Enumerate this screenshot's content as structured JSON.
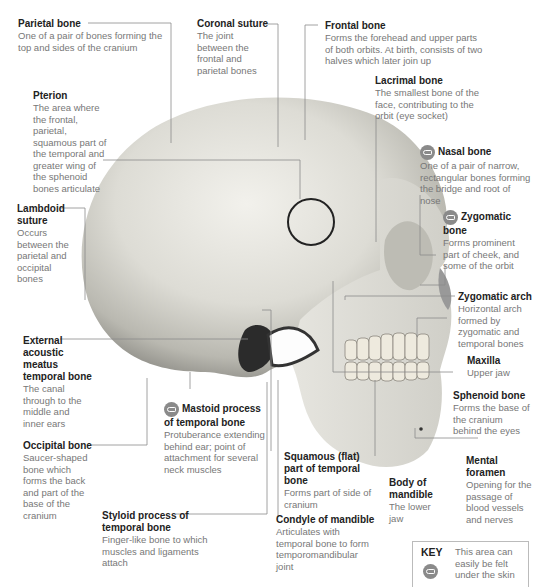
{
  "diagram": {
    "labels": [
      {
        "id": "parietal",
        "title": "Parietal bone",
        "desc": "One of a pair of bones forming the top and sides of the cranium",
        "palpable": false
      },
      {
        "id": "coronal",
        "title": "Coronal suture",
        "desc": "The joint between the frontal and parietal bones",
        "palpable": false
      },
      {
        "id": "frontal",
        "title": "Frontal bone",
        "desc": "Forms the forehead and upper parts of both orbits. At birth, consists of two halves which later join up",
        "palpable": false
      },
      {
        "id": "lacrimal",
        "title": "Lacrimal bone",
        "desc": "The smallest bone of the face, contributing to the orbit (eye socket)",
        "palpable": false
      },
      {
        "id": "pterion",
        "title": "Pterion",
        "desc": "The area where the frontal, parietal, squamous part of the temporal and greater wing of the sphenoid bones articulate",
        "palpable": false
      },
      {
        "id": "nasal",
        "title": "Nasal bone",
        "desc": "One of a pair of narrow, rectangular bones forming the bridge and root of nose",
        "palpable": true
      },
      {
        "id": "zygomatic",
        "title": "Zygomatic bone",
        "desc": "Forms prominent part of cheek, and some of the orbit",
        "palpable": true
      },
      {
        "id": "lambdoid",
        "title": "Lambdoid suture",
        "desc": "Occurs between the parietal and occipital bones",
        "palpable": false
      },
      {
        "id": "zygarch",
        "title": "Zygomatic arch",
        "desc": "Horizontal arch formed by zygomatic and temporal bones",
        "palpable": false
      },
      {
        "id": "eam",
        "title": "External acoustic meatus temporal bone",
        "desc": "The canal through to the middle and inner ears",
        "palpable": false
      },
      {
        "id": "maxilla",
        "title": "Maxilla",
        "desc": "Upper jaw",
        "palpable": false
      },
      {
        "id": "sphenoid",
        "title": "Sphenoid bone",
        "desc": "Forms the base of the cranium behind the eyes",
        "palpable": false
      },
      {
        "id": "mastoid",
        "title": "Mastoid process of temporal bone",
        "desc": "Protuberance extending behind ear; point of attachment for several neck muscles",
        "palpable": true
      },
      {
        "id": "occipital",
        "title": "Occipital bone",
        "desc": "Saucer-shaped bone which forms the back and part of the base of the cranium",
        "palpable": false
      },
      {
        "id": "mental",
        "title": "Mental foramen",
        "desc": "Opening for the passage of blood vessels and nerves",
        "palpable": false
      },
      {
        "id": "squamous",
        "title": "Squamous (flat) part of temporal bone",
        "desc": "Forms part of side of cranium",
        "palpable": false
      },
      {
        "id": "mandible",
        "title": "Body of mandible",
        "desc": "The lower jaw",
        "palpable": false
      },
      {
        "id": "styloid",
        "title": "Styloid process of temporal bone",
        "desc": "Finger-like bone to which muscles and ligaments attach",
        "palpable": false
      },
      {
        "id": "condyle",
        "title": "Condyle of mandible",
        "desc": "Articulates with temporal bone to form temporomandibular joint",
        "palpable": false
      }
    ],
    "key": {
      "title": "KEY",
      "icon": "palpable-hand-icon",
      "desc": "This area can easily be felt under the skin"
    }
  }
}
